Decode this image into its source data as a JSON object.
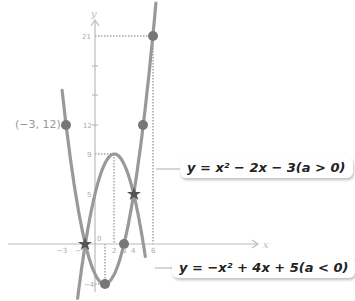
{
  "chart_data": {
    "type": "line",
    "title": "",
    "xlabel": "x",
    "ylabel": "y",
    "x_ticks": [
      -3,
      -1,
      2,
      3,
      4,
      6
    ],
    "y_ticks": [
      -4,
      5,
      9,
      12,
      21
    ],
    "series": [
      {
        "name": "y = x^2 - 2x - 3 (a > 0)",
        "equation": "x^2-2x-3",
        "x_range": [
          -3.4,
          6.3
        ],
        "points": [
          [
            -3,
            12
          ],
          [
            -1,
            0
          ],
          [
            1,
            -4
          ],
          [
            3,
            0
          ],
          [
            4,
            5
          ],
          [
            5,
            12
          ],
          [
            6,
            21
          ]
        ]
      },
      {
        "name": "y = -x^2 + 4x + 5 (a < 0)",
        "equation": "-x^2+4x+5",
        "x_range": [
          -1.8,
          5.2
        ],
        "points": [
          [
            -1,
            0
          ],
          [
            2,
            9
          ],
          [
            4,
            5
          ],
          [
            5,
            0
          ]
        ]
      }
    ],
    "marked_points": [
      {
        "x": -3,
        "y": 12,
        "label": "(−3, 12)",
        "marker": "dot"
      },
      {
        "x": 5,
        "y": 12,
        "marker": "dot"
      },
      {
        "x": 6,
        "y": 21,
        "marker": "dot"
      },
      {
        "x": 1,
        "y": -4,
        "marker": "dot"
      },
      {
        "x": 3,
        "y": 0,
        "marker": "dot"
      },
      {
        "x": -1,
        "y": 0,
        "marker": "star"
      },
      {
        "x": 4,
        "y": 5,
        "marker": "star"
      }
    ]
  },
  "labels": {
    "upper_eq": "y = x² − 2x − 3(a > 0)",
    "lower_eq": "y = −x² + 4x + 5(a < 0)",
    "point_label": "(−3, 12)",
    "axis_x": "x",
    "axis_y": "y",
    "tick_21": "21",
    "tick_12": "12",
    "tick_9": "9",
    "tick_5": "5",
    "tick_neg4": "−4",
    "tick_neg3": "−3",
    "tick_neg1": "−1",
    "tick_2": "2",
    "tick_3": "3",
    "tick_4": "4",
    "tick_6": "6",
    "tick_0": "0"
  }
}
